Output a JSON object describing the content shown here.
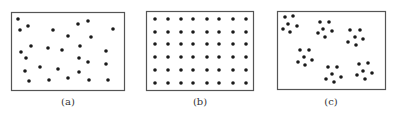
{
  "colors": {
    "dot": "#1a1a1a",
    "frame": "#555555",
    "caption": "#333333"
  },
  "panels": [
    {
      "id": "a",
      "caption": "(a)",
      "pattern": "random",
      "frame": {
        "x": 11,
        "y": 12,
        "w": 113,
        "h": 78
      },
      "dots": [
        [
          18,
          19
        ],
        [
          20,
          30
        ],
        [
          28,
          26
        ],
        [
          53,
          30
        ],
        [
          78,
          24
        ],
        [
          88,
          21
        ],
        [
          113,
          29
        ],
        [
          68,
          36
        ],
        [
          91,
          37
        ],
        [
          31,
          46
        ],
        [
          48,
          48
        ],
        [
          62,
          50
        ],
        [
          80,
          46
        ],
        [
          21,
          52
        ],
        [
          106,
          51
        ],
        [
          26,
          58
        ],
        [
          79,
          58
        ],
        [
          88,
          62
        ],
        [
          106,
          64
        ],
        [
          40,
          67
        ],
        [
          58,
          69
        ],
        [
          25,
          71
        ],
        [
          79,
          72
        ],
        [
          29,
          81
        ],
        [
          49,
          80
        ],
        [
          68,
          78
        ],
        [
          89,
          80
        ],
        [
          108,
          80
        ]
      ]
    },
    {
      "id": "b",
      "caption": "(b)",
      "pattern": "uniform",
      "frame": {
        "x": 146,
        "y": 11,
        "w": 107,
        "h": 79
      },
      "grid": {
        "cols": [
          155,
          168,
          181,
          193,
          207,
          219,
          233,
          246
        ],
        "rows": [
          19,
          32,
          44,
          57,
          70,
          83
        ]
      }
    },
    {
      "id": "c",
      "caption": "(c)",
      "pattern": "clustered",
      "frame": {
        "x": 277,
        "y": 11,
        "w": 108,
        "h": 78
      },
      "dots": [
        [
          285,
          17
        ],
        [
          293,
          16
        ],
        [
          288,
          24
        ],
        [
          297,
          26
        ],
        [
          283,
          29
        ],
        [
          290,
          32
        ],
        [
          320,
          22
        ],
        [
          329,
          22
        ],
        [
          323,
          29
        ],
        [
          332,
          31
        ],
        [
          318,
          33
        ],
        [
          325,
          37
        ],
        [
          350,
          30
        ],
        [
          360,
          30
        ],
        [
          355,
          37
        ],
        [
          363,
          39
        ],
        [
          348,
          42
        ],
        [
          356,
          45
        ],
        [
          300,
          50
        ],
        [
          309,
          50
        ],
        [
          304,
          57
        ],
        [
          312,
          60
        ],
        [
          298,
          62
        ],
        [
          305,
          65
        ],
        [
          328,
          67
        ],
        [
          337,
          67
        ],
        [
          332,
          74
        ],
        [
          341,
          77
        ],
        [
          326,
          79
        ],
        [
          334,
          82
        ],
        [
          359,
          64
        ],
        [
          368,
          63
        ],
        [
          363,
          71
        ],
        [
          372,
          73
        ],
        [
          357,
          75
        ],
        [
          365,
          79
        ]
      ]
    }
  ]
}
